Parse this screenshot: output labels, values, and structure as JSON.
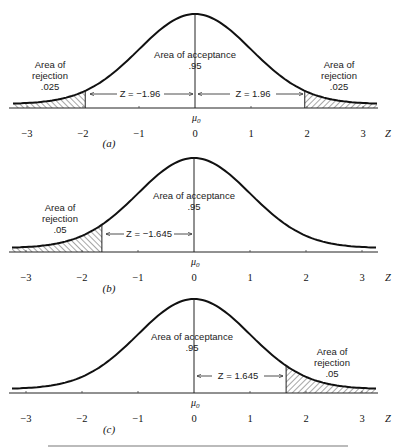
{
  "chart_data": [
    {
      "type": "area",
      "panel": "(a)",
      "title": "Two-tailed test, alpha = .05",
      "xlabel": "Z",
      "x_ticks": [
        -3,
        -2,
        -1,
        0,
        1,
        2,
        3
      ],
      "center_label": "μ0",
      "distribution": "standard normal",
      "acceptance": {
        "label": "Area of acceptance",
        "value": ".95"
      },
      "rejection_regions": [
        {
          "side": "left",
          "label_lines": [
            "Area of",
            "rejection",
            ".025"
          ],
          "critical_z": -1.96,
          "arrow_label": "Z = −1.96"
        },
        {
          "side": "right",
          "label_lines": [
            "Area of",
            "rejection",
            ".025"
          ],
          "critical_z": 1.96,
          "arrow_label": "Z = 1.96"
        }
      ]
    },
    {
      "type": "area",
      "panel": "(b)",
      "title": "Left-tailed test, alpha = .05",
      "xlabel": "Z",
      "x_ticks": [
        -3,
        -2,
        -1,
        0,
        1,
        2,
        3
      ],
      "center_label": "μ0",
      "distribution": "standard normal",
      "acceptance": {
        "label": "Area of acceptance",
        "value": ".95"
      },
      "rejection_regions": [
        {
          "side": "left",
          "label_lines": [
            "Area of",
            "rejection",
            ".05"
          ],
          "critical_z": -1.645,
          "arrow_label": "Z = −1.645"
        }
      ]
    },
    {
      "type": "area",
      "panel": "(c)",
      "title": "Right-tailed test, alpha = .05",
      "xlabel": "Z",
      "x_ticks": [
        -3,
        -2,
        -1,
        0,
        1,
        2,
        3
      ],
      "center_label": "μ0",
      "distribution": "standard normal",
      "acceptance": {
        "label": "Area of acceptance",
        "value": ".95"
      },
      "rejection_regions": [
        {
          "side": "right",
          "label_lines": [
            "Area of",
            "rejection",
            ".05"
          ],
          "critical_z": 1.645,
          "arrow_label": "Z = 1.645"
        }
      ]
    }
  ],
  "panels": {
    "a": {
      "tag": "(a)",
      "accept_line1": "Area of acceptance",
      "accept_line2": ".95",
      "left_rej": [
        "Area of",
        "rejection",
        ".025"
      ],
      "right_rej": [
        "Area of",
        "rejection",
        ".025"
      ],
      "left_arrow": "Z = −1.96",
      "right_arrow": "Z = 1.96",
      "mu": "μ",
      "mu_sub": "0"
    },
    "b": {
      "tag": "(b)",
      "accept_line1": "Area of acceptance",
      "accept_line2": ".95",
      "left_rej": [
        "Area of",
        "rejection",
        ".05"
      ],
      "left_arrow": "Z = −1.645",
      "mu": "μ",
      "mu_sub": "0"
    },
    "c": {
      "tag": "(c)",
      "accept_line1": "Area of acceptance",
      "accept_line2": ".95",
      "right_rej": [
        "Area of",
        "rejection",
        ".05"
      ],
      "right_arrow": "Z = 1.645",
      "mu": "μ",
      "mu_sub": "0"
    }
  },
  "axis": {
    "ticks": [
      "−3",
      "−2",
      "−1",
      "0",
      "1",
      "2",
      "3"
    ],
    "z_label": "Z"
  }
}
